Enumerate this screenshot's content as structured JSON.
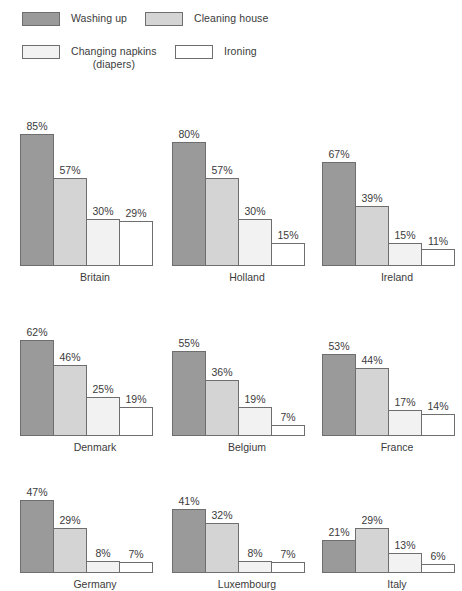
{
  "legend": {
    "items": [
      {
        "label": "Washing up",
        "color": "#9a9a9a",
        "name": "washing-up"
      },
      {
        "label": "Cleaning house",
        "color": "#d4d4d4",
        "name": "cleaning-house"
      },
      {
        "label": "Changing napkins\n(diapers)",
        "color": "#f2f2f2",
        "name": "changing-napkins"
      },
      {
        "label": "Ironing",
        "color": "#ffffff",
        "name": "ironing"
      }
    ]
  },
  "chart_data": {
    "type": "bar",
    "title": "",
    "xlabel": "",
    "ylabel": "",
    "ylim": [
      0,
      85
    ],
    "grid": false,
    "legend_position": "top",
    "value_suffix": "%",
    "categories": [
      "Britain",
      "Holland",
      "Ireland",
      "Denmark",
      "Belgium",
      "France",
      "Germany",
      "Luxembourg",
      "Italy"
    ],
    "series": [
      {
        "name": "Washing up",
        "color": "#9a9a9a",
        "values": [
          85,
          80,
          67,
          62,
          55,
          53,
          47,
          41,
          21
        ]
      },
      {
        "name": "Cleaning house",
        "color": "#d4d4d4",
        "values": [
          57,
          57,
          39,
          46,
          36,
          44,
          29,
          32,
          29
        ]
      },
      {
        "name": "Changing napkins (diapers)",
        "color": "#f2f2f2",
        "values": [
          30,
          30,
          15,
          25,
          19,
          17,
          8,
          8,
          13
        ]
      },
      {
        "name": "Ironing",
        "color": "#ffffff",
        "values": [
          29,
          15,
          11,
          19,
          7,
          14,
          7,
          7,
          6
        ]
      }
    ],
    "clusters": [
      {
        "label": "Britain",
        "values": [
          85,
          57,
          30,
          29
        ],
        "labels": [
          "85%",
          "57%",
          "30%",
          "29%"
        ]
      },
      {
        "label": "Holland",
        "values": [
          80,
          57,
          30,
          15
        ],
        "labels": [
          "80%",
          "57%",
          "30%",
          "15%"
        ]
      },
      {
        "label": "Ireland",
        "values": [
          67,
          39,
          15,
          11
        ],
        "labels": [
          "67%",
          "39%",
          "15%",
          "11%"
        ]
      },
      {
        "label": "Denmark",
        "values": [
          62,
          46,
          25,
          19
        ],
        "labels": [
          "62%",
          "46%",
          "25%",
          "19%"
        ]
      },
      {
        "label": "Belgium",
        "values": [
          55,
          36,
          19,
          7
        ],
        "labels": [
          "55%",
          "36%",
          "19%",
          "7%"
        ]
      },
      {
        "label": "France",
        "values": [
          53,
          44,
          17,
          14
        ],
        "labels": [
          "53%",
          "44%",
          "17%",
          "14%"
        ]
      },
      {
        "label": "Germany",
        "values": [
          47,
          29,
          8,
          7
        ],
        "labels": [
          "47%",
          "29%",
          "8%",
          "7%"
        ]
      },
      {
        "label": "Luxembourg",
        "values": [
          41,
          32,
          8,
          7
        ],
        "labels": [
          "41%",
          "32%",
          "8%",
          "7%"
        ]
      },
      {
        "label": "Italy",
        "values": [
          21,
          29,
          13,
          6
        ],
        "labels": [
          "21%",
          "29%",
          "13%",
          "6%"
        ]
      }
    ]
  },
  "layout": {
    "columns_x": [
      20,
      172,
      322
    ],
    "rows_y": [
      0,
      190,
      355
    ],
    "row_plot_heights": [
      140,
      120,
      92
    ],
    "px_per_unit": 1.55
  }
}
